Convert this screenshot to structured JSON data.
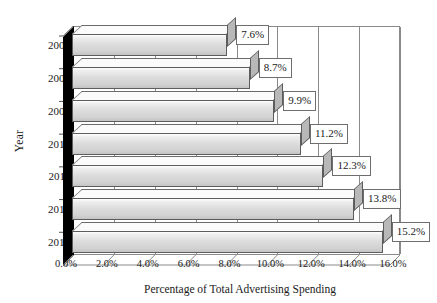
{
  "chart_data": {
    "type": "bar",
    "orientation": "horizontal",
    "title": "",
    "xlabel": "Percentage of Total Advertising Spending",
    "ylabel": "Year",
    "categories": [
      "2007",
      "2008",
      "2009",
      "2010",
      "2011",
      "2012",
      "2013"
    ],
    "values": [
      7.6,
      8.7,
      9.9,
      11.2,
      12.3,
      13.8,
      15.2
    ],
    "data_labels": [
      "7.6%",
      "8.7%",
      "9.9%",
      "11.2%",
      "12.3%",
      "13.8%",
      "15.2%"
    ],
    "xlim": [
      0.0,
      16.0
    ],
    "xticks": [
      0.0,
      2.0,
      4.0,
      6.0,
      8.0,
      10.0,
      12.0,
      14.0,
      16.0
    ],
    "xtick_labels": [
      "0.0%",
      "2.0%",
      "4.0%",
      "6.0%",
      "8.0%",
      "10.0%",
      "12.0%",
      "14.0%",
      "16.0%"
    ],
    "grid": "vertical",
    "legend": "none",
    "style_3d": true,
    "colors": {
      "bar_fill": "#d9d9d9",
      "bar_edge": "#5d5d5d",
      "bar_top": "#fbfbfb",
      "bar_cap": "#b8b8b8",
      "wall": "#000000",
      "gridline": "#8a8a8a",
      "frame": "#8a8a8a",
      "label_box_fill": "#ffffff",
      "label_box_edge": "#6e6e6e",
      "text": "#1a1a1a",
      "background": "#ffffff"
    }
  }
}
